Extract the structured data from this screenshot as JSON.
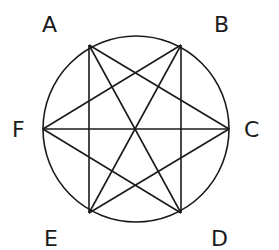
{
  "diagram": {
    "points": [
      {
        "id": "A",
        "label": "A"
      },
      {
        "id": "B",
        "label": "B"
      },
      {
        "id": "C",
        "label": "C"
      },
      {
        "id": "D",
        "label": "D"
      },
      {
        "id": "E",
        "label": "E"
      },
      {
        "id": "F",
        "label": "F"
      }
    ],
    "edges": [
      [
        "A",
        "E"
      ],
      [
        "A",
        "D"
      ],
      [
        "A",
        "C"
      ],
      [
        "B",
        "D"
      ],
      [
        "B",
        "E"
      ],
      [
        "B",
        "F"
      ],
      [
        "F",
        "C"
      ],
      [
        "F",
        "D"
      ],
      [
        "C",
        "E"
      ]
    ],
    "circle": "circumscribed circle through all six points",
    "line_color": "#1a1a1a"
  }
}
